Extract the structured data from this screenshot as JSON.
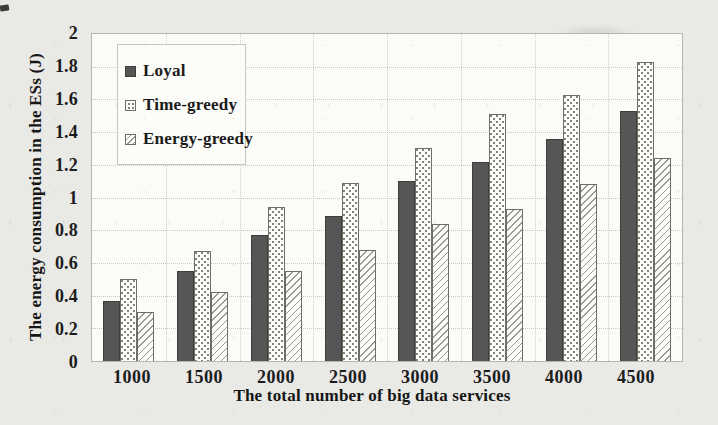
{
  "chart_data": {
    "type": "bar",
    "title": "",
    "xlabel": "The total number of big data services",
    "ylabel": "The energy consumption in the ESs (J)",
    "categories": [
      "1000",
      "1500",
      "2000",
      "2500",
      "3000",
      "3500",
      "4000",
      "4500"
    ],
    "series": [
      {
        "name": "Loyal",
        "pattern": "solid",
        "color": "#565656",
        "values": [
          0.37,
          0.55,
          0.77,
          0.89,
          1.1,
          1.22,
          1.36,
          1.53
        ]
      },
      {
        "name": "Time-greedy",
        "pattern": "dots",
        "color": "#fcfcf9",
        "values": [
          0.5,
          0.67,
          0.94,
          1.09,
          1.3,
          1.51,
          1.63,
          1.83
        ]
      },
      {
        "name": "Energy-greedy",
        "pattern": "hatch",
        "color": "#fcfcf9",
        "values": [
          0.3,
          0.42,
          0.55,
          0.68,
          0.84,
          0.93,
          1.08,
          1.24
        ]
      }
    ],
    "ylim": [
      0,
      2
    ],
    "ytick_labels": [
      "0",
      "0.2",
      "0.4",
      "0.6",
      "0.8",
      "1",
      "1.2",
      "1.4",
      "1.6",
      "1.8",
      "2"
    ],
    "grid": true,
    "legend_position": "top-left"
  },
  "palette": {
    "page_background": "#e9e9e6",
    "plot_background": "#fbfbf8",
    "bar_dark_fill": "#565656",
    "pattern_ink": "#82827c",
    "grid_line": "#c9c9c3",
    "axis_text": "#1c1c1c"
  }
}
